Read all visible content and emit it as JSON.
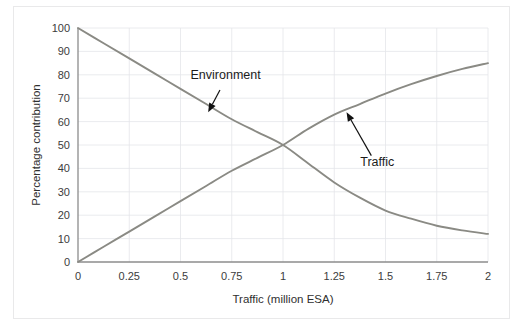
{
  "chart_data": {
    "type": "line",
    "title": "",
    "subtitle": "",
    "xlabel": "Traffic (million ESA)",
    "ylabel": "Percentage contribution",
    "xlim": [
      0,
      2
    ],
    "ylim": [
      0,
      100
    ],
    "xticks": [
      0,
      0.25,
      0.5,
      0.75,
      1,
      1.25,
      1.5,
      1.75,
      2
    ],
    "xticklabels": [
      "0",
      "0.25",
      "0.5",
      "0.75",
      "1",
      "1.25",
      "1.5",
      "1.75",
      "2"
    ],
    "yticks": [
      0,
      10,
      20,
      30,
      40,
      50,
      60,
      70,
      80,
      90,
      100
    ],
    "yticklabels": [
      "0",
      "10",
      "20",
      "30",
      "40",
      "50",
      "60",
      "70",
      "80",
      "90",
      "100"
    ],
    "grid": true,
    "grid_axis": "both",
    "legend": "none",
    "series": [
      {
        "name": "Environment",
        "color": "#8a8a84",
        "x": [
          0,
          0.125,
          0.25,
          0.375,
          0.5,
          0.625,
          0.75,
          0.875,
          1,
          1.125,
          1.25,
          1.375,
          1.5,
          1.625,
          1.75,
          1.875,
          2
        ],
        "values": [
          100,
          93.5,
          87,
          80.5,
          74,
          67.5,
          61,
          55.5,
          50,
          42,
          34,
          27.5,
          22,
          18.5,
          15.5,
          13.5,
          12
        ]
      },
      {
        "name": "Traffic",
        "color": "#8a8a84",
        "x": [
          0,
          0.125,
          0.25,
          0.375,
          0.5,
          0.625,
          0.75,
          0.875,
          1,
          1.125,
          1.25,
          1.375,
          1.5,
          1.625,
          1.75,
          1.875,
          2
        ],
        "values": [
          0,
          6.5,
          13,
          19.5,
          26,
          32.5,
          39,
          44.5,
          50,
          57,
          63,
          67.5,
          72,
          76,
          79.5,
          82.5,
          85
        ]
      }
    ],
    "annotations": [
      {
        "text": "Environment",
        "label_x": 0.72,
        "label_y": 78,
        "point_x": 0.635,
        "point_y": 64
      },
      {
        "text": "Traffic",
        "label_x": 1.46,
        "label_y": 41,
        "point_x": 1.31,
        "point_y": 64
      }
    ]
  }
}
